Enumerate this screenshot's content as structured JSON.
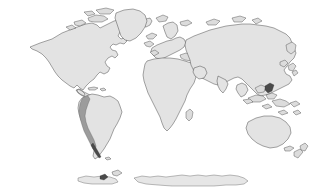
{
  "map": {
    "title": "World Map",
    "projection": "equirectangular",
    "background_color": "#ffffff",
    "land_fill_color": "#e3e3e3",
    "land_outline_color": "#3a3a3a",
    "highlight_color": "#9c9c9c",
    "highlight_dark_color": "#4a4a4a",
    "antarctica_fill_color": "#e6e6e6",
    "highlighted_feature": "Andes mountain range",
    "highlighted_region": "western South America",
    "regions": [
      {
        "name": "North America",
        "label": "North America",
        "fill": "#e3e3e3"
      },
      {
        "name": "Greenland",
        "label": "Greenland",
        "fill": "#e3e3e3"
      },
      {
        "name": "South America",
        "label": "South America",
        "fill": "#e3e3e3"
      },
      {
        "name": "Europe",
        "label": "Europe",
        "fill": "#e3e3e3"
      },
      {
        "name": "Africa",
        "label": "Africa",
        "fill": "#e3e3e3"
      },
      {
        "name": "Asia",
        "label": "Asia",
        "fill": "#e3e3e3"
      },
      {
        "name": "Australia",
        "label": "Australia",
        "fill": "#e3e3e3"
      },
      {
        "name": "New Zealand",
        "label": "New Zealand",
        "fill": "#e3e3e3"
      },
      {
        "name": "Antarctica",
        "label": "Antarctica",
        "fill": "#e6e6e6"
      },
      {
        "name": "Andes",
        "label": "Andes",
        "fill": "#9c9c9c"
      }
    ],
    "visible_text": []
  }
}
